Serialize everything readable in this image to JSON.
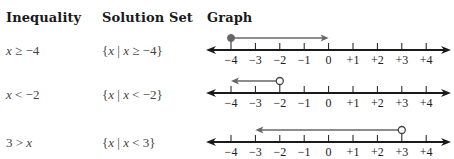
{
  "headers": {
    "inequality": "Inequality",
    "solution_set": "Solution Set",
    "graph": "Graph"
  },
  "rows": [
    {
      "inequality_var": "x",
      "inequality_rest": " ≥ −4",
      "set_open": "{",
      "set_var1": "x",
      "set_bar": " | ",
      "set_var2": "x",
      "set_rest": " ≥ −4}",
      "graph": {
        "endpoint": -4,
        "endpoint_type": "closed",
        "direction": "right",
        "ray_to": 0
      }
    },
    {
      "inequality_var": "x",
      "inequality_rest": " < −2",
      "set_open": "{",
      "set_var1": "x",
      "set_bar": " | ",
      "set_var2": "x",
      "set_rest": " < −2}",
      "graph": {
        "endpoint": -2,
        "endpoint_type": "open",
        "direction": "left",
        "ray_to": -4
      }
    },
    {
      "inequality_pre": "3 > ",
      "inequality_var": "x",
      "set_open": "{",
      "set_var1": "x",
      "set_bar": " | ",
      "set_var2": "x",
      "set_rest": " < 3}",
      "graph": {
        "endpoint": 3,
        "endpoint_type": "open",
        "direction": "left",
        "ray_to": -3
      }
    }
  ],
  "number_line": {
    "tick_labels": [
      "−4",
      "−3",
      "−2",
      "−1",
      "0",
      "+1",
      "+2",
      "+3",
      "+4"
    ],
    "min": -4,
    "max": 4
  },
  "colors": {
    "axis": "#1a1a1a",
    "ray": "#666666"
  }
}
